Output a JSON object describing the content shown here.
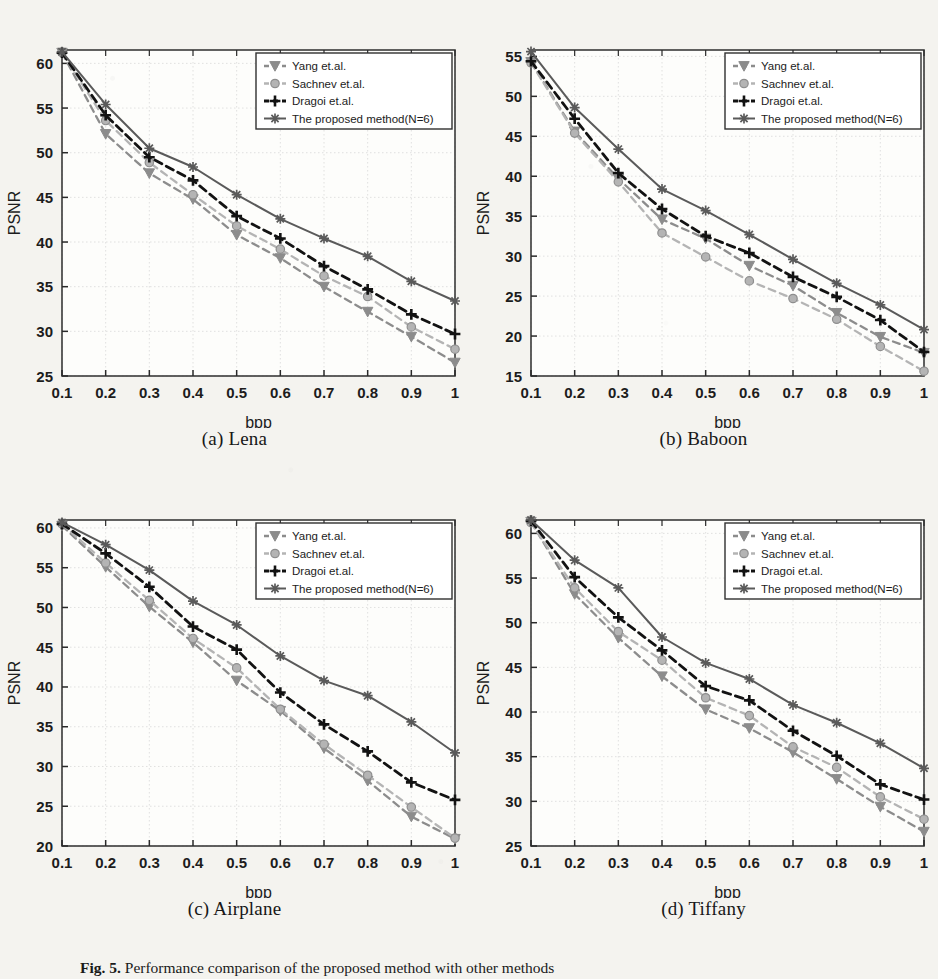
{
  "figure": {
    "caption_prefix": "Fig. 5.",
    "caption_text": "Performance comparison of the proposed method with other methods"
  },
  "legend": {
    "entries": [
      {
        "label": "Yang et.al.",
        "marker": "triangle-down",
        "color": "#8f8f8f",
        "style": "dashed"
      },
      {
        "label": "Sachnev et.al.",
        "marker": "circle",
        "color": "#b0b0b0",
        "style": "dashed"
      },
      {
        "label": "Dragoi et.al.",
        "marker": "plus",
        "color": "#111111",
        "style": "dashed"
      },
      {
        "label": "The proposed method(N=6)",
        "marker": "star",
        "color": "#555555",
        "style": "solid"
      }
    ]
  },
  "axis": {
    "xlabel": "bpp",
    "ylabel": "PSNR",
    "xticks": [
      "0.1",
      "0.2",
      "0.3",
      "0.4",
      "0.5",
      "0.6",
      "0.7",
      "0.8",
      "0.9",
      "1"
    ]
  },
  "panels": [
    {
      "id": "a",
      "caption": "(a) Lena"
    },
    {
      "id": "b",
      "caption": "(b) Baboon"
    },
    {
      "id": "c",
      "caption": "(c) Airplane"
    },
    {
      "id": "d",
      "caption": "(d) Tiffany"
    }
  ],
  "chart_data": [
    {
      "type": "line",
      "panel": "a",
      "title": "(a) Lena",
      "xlabel": "bpp",
      "ylabel": "PSNR",
      "x": [
        0.1,
        0.2,
        0.3,
        0.4,
        0.5,
        0.6,
        0.7,
        0.8,
        0.9,
        1.0
      ],
      "xlim": [
        0.1,
        1.0
      ],
      "ylim": [
        25,
        61.5
      ],
      "yticks": [
        25,
        30,
        35,
        40,
        45,
        50,
        55,
        60
      ],
      "grid": true,
      "legend_position": "top-right",
      "series": [
        {
          "name": "Yang et.al.",
          "values": [
            61.2,
            52.1,
            47.7,
            44.8,
            40.8,
            38.2,
            35.0,
            32.2,
            29.4,
            26.5
          ]
        },
        {
          "name": "Sachnev et.al.",
          "values": [
            61.2,
            53.6,
            48.9,
            45.3,
            41.8,
            39.2,
            36.2,
            33.9,
            30.5,
            28.0
          ]
        },
        {
          "name": "Dragoi et.al.",
          "values": [
            61.2,
            54.2,
            49.5,
            46.9,
            42.9,
            40.4,
            37.3,
            34.7,
            31.9,
            29.7
          ]
        },
        {
          "name": "The proposed method(N=6)",
          "values": [
            61.3,
            55.4,
            50.5,
            48.4,
            45.3,
            42.6,
            40.4,
            38.4,
            35.6,
            33.4
          ]
        }
      ]
    },
    {
      "type": "line",
      "panel": "b",
      "title": "(b) Baboon",
      "xlabel": "bpp",
      "ylabel": "PSNR",
      "x": [
        0.1,
        0.2,
        0.3,
        0.4,
        0.5,
        0.6,
        0.7,
        0.8,
        0.9,
        1.0
      ],
      "xlim": [
        0.1,
        1.0
      ],
      "ylim": [
        15,
        55.8
      ],
      "yticks": [
        15,
        20,
        25,
        30,
        35,
        40,
        45,
        50,
        55
      ],
      "grid": true,
      "legend_position": "top-right",
      "series": [
        {
          "name": "Yang et.al.",
          "values": [
            54.3,
            45.6,
            39.7,
            34.6,
            32.2,
            28.8,
            26.3,
            22.9,
            19.9,
            17.9
          ]
        },
        {
          "name": "Sachnev et.al.",
          "values": [
            54.2,
            45.4,
            39.3,
            32.9,
            29.9,
            26.9,
            24.7,
            22.1,
            18.7,
            15.6
          ]
        },
        {
          "name": "Dragoi et.al.",
          "values": [
            54.4,
            47.2,
            40.4,
            35.9,
            32.5,
            30.4,
            27.4,
            24.9,
            22.0,
            18.0
          ]
        },
        {
          "name": "The proposed method(N=6)",
          "values": [
            55.6,
            48.6,
            43.4,
            38.4,
            35.7,
            32.7,
            29.6,
            26.6,
            23.9,
            20.8
          ]
        }
      ]
    },
    {
      "type": "line",
      "panel": "c",
      "title": "(c) Airplane",
      "xlabel": "bpp",
      "ylabel": "PSNR",
      "x": [
        0.1,
        0.2,
        0.3,
        0.4,
        0.5,
        0.6,
        0.7,
        0.8,
        0.9,
        1.0
      ],
      "xlim": [
        0.1,
        1.0
      ],
      "ylim": [
        20,
        61
      ],
      "yticks": [
        20,
        25,
        30,
        35,
        40,
        45,
        50,
        55,
        60
      ],
      "grid": true,
      "legend_position": "top-right",
      "series": [
        {
          "name": "Yang et.al.",
          "values": [
            60.3,
            55.1,
            50.1,
            45.6,
            40.8,
            37.0,
            32.3,
            28.2,
            23.7,
            20.9
          ]
        },
        {
          "name": "Sachnev et.al.",
          "values": [
            60.5,
            55.6,
            50.9,
            46.1,
            42.4,
            37.2,
            32.8,
            28.9,
            24.9,
            21.0
          ]
        },
        {
          "name": "Dragoi et.al.",
          "values": [
            60.5,
            56.8,
            52.6,
            47.6,
            44.7,
            39.3,
            35.3,
            31.9,
            28.0,
            25.8
          ]
        },
        {
          "name": "The proposed method(N=6)",
          "values": [
            60.7,
            57.9,
            54.7,
            50.8,
            47.8,
            43.9,
            40.8,
            38.9,
            35.6,
            31.7
          ]
        }
      ]
    },
    {
      "type": "line",
      "panel": "d",
      "title": "(d) Tiffany",
      "xlabel": "bpp",
      "ylabel": "PSNR",
      "x": [
        0.1,
        0.2,
        0.3,
        0.4,
        0.5,
        0.6,
        0.7,
        0.8,
        0.9,
        1.0
      ],
      "xlim": [
        0.1,
        1.0
      ],
      "ylim": [
        25,
        61.5
      ],
      "yticks": [
        25,
        30,
        35,
        40,
        45,
        50,
        55,
        60
      ],
      "grid": true,
      "legend_position": "top-right",
      "series": [
        {
          "name": "Yang et.al.",
          "values": [
            61.3,
            53.2,
            48.3,
            44.0,
            40.3,
            38.2,
            35.5,
            32.5,
            29.4,
            26.6
          ]
        },
        {
          "name": "Sachnev et.al.",
          "values": [
            61.2,
            53.9,
            49.0,
            45.8,
            41.6,
            39.6,
            36.1,
            33.8,
            30.5,
            28.0
          ]
        },
        {
          "name": "Dragoi et.al.",
          "values": [
            61.4,
            55.1,
            50.6,
            46.9,
            42.9,
            41.3,
            37.9,
            35.1,
            31.9,
            30.2
          ]
        },
        {
          "name": "The proposed method(N=6)",
          "values": [
            61.5,
            57.0,
            53.9,
            48.4,
            45.5,
            43.7,
            40.8,
            38.8,
            36.5,
            33.7
          ]
        }
      ]
    }
  ]
}
